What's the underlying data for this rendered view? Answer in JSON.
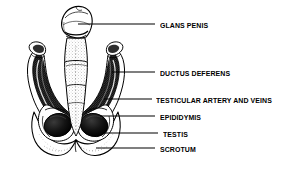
{
  "figure": {
    "style": "black and white engraving / stipple line art",
    "background_color": "#ffffff",
    "ink_color": "#000000"
  },
  "labels": [
    {
      "id": "glans-penis",
      "text": "GLANS PENIS",
      "leader": {
        "x1": 78,
        "y1": 24,
        "x2": 155,
        "y2": 24
      }
    },
    {
      "id": "ductus-deferens",
      "text": "DUCTUS DEFERENS",
      "leader": {
        "x1": 112,
        "y1": 72,
        "x2": 155,
        "y2": 72
      }
    },
    {
      "id": "testicular-artery-and-veins",
      "text": "TESTICULAR ARTERY AND  VEINS",
      "leader": {
        "x1": 104,
        "y1": 99,
        "x2": 152,
        "y2": 99
      }
    },
    {
      "id": "epididymis",
      "text": "EPIDIDYMIS",
      "leader": {
        "x1": 100,
        "y1": 116,
        "x2": 155,
        "y2": 116
      }
    },
    {
      "id": "testis",
      "text": "TESTIS",
      "leader": {
        "x1": 104,
        "y1": 133,
        "x2": 158,
        "y2": 133
      }
    },
    {
      "id": "scrotum",
      "text": "SCROTUM",
      "leader": {
        "x1": 96,
        "y1": 148,
        "x2": 155,
        "y2": 148
      }
    }
  ]
}
